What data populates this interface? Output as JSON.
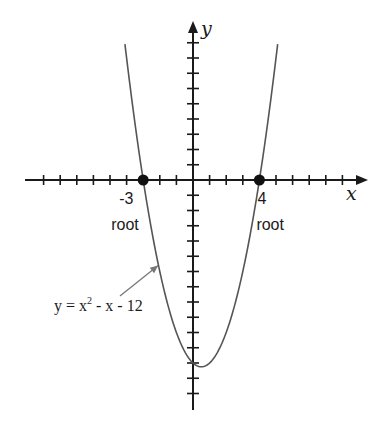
{
  "chart_data": {
    "type": "line",
    "title": "",
    "xlabel": "x",
    "ylabel": "y",
    "function": "y = x^2 - x - 12",
    "xlim": [
      -10,
      10.5
    ],
    "ylim": [
      -15,
      10.5
    ],
    "x_ticks": [
      -9,
      -8,
      -7,
      -6,
      -5,
      -4,
      -3,
      -2,
      -1,
      1,
      2,
      3,
      4,
      5,
      6,
      7,
      8,
      9
    ],
    "y_ticks": [
      9,
      8,
      7,
      6,
      5,
      4,
      3,
      2,
      1,
      -1,
      -2,
      -3,
      -4,
      -5,
      -6,
      -7,
      -8,
      -9,
      -10,
      -11,
      -12,
      -13,
      -14
    ],
    "grid": false,
    "curve_domain": [
      -4.1,
      5.1
    ],
    "series": [
      {
        "name": "y = x² - x - 12",
        "color": "#555555"
      }
    ],
    "roots": [
      {
        "x": -3,
        "y": 0,
        "value_label": "-3",
        "text": "root"
      },
      {
        "x": 4,
        "y": 0,
        "value_label": "4",
        "text": "root"
      }
    ],
    "annotation": {
      "text_main": "y = x",
      "text_sup": "2",
      "text_rest": " - x - 12",
      "points_to": {
        "x": -2.1,
        "y": -5.6
      }
    }
  }
}
